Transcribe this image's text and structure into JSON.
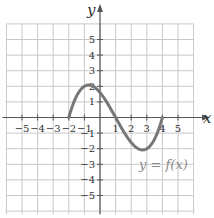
{
  "chart_data": {
    "type": "line",
    "title": "",
    "xlabel": "x",
    "ylabel": "y",
    "xlim": [
      -6,
      6
    ],
    "ylim": [
      -6,
      6
    ],
    "grid": true,
    "x_ticks": [
      "-5",
      "-4",
      "-3",
      "-2",
      "-1",
      "1",
      "2",
      "3",
      "4",
      "5"
    ],
    "y_ticks": [
      "5",
      "4",
      "3",
      "2",
      "1",
      "-1",
      "-2",
      "-3",
      "-4",
      "-5"
    ],
    "series": [
      {
        "name": "y = f(x)",
        "color": "#777777",
        "domain": [
          -2,
          4
        ],
        "x": [
          -2,
          -1.5,
          -1,
          -0.5,
          0,
          0.5,
          1,
          1.5,
          2,
          2.5,
          3,
          3.5,
          4
        ],
        "y": [
          0,
          1.1,
          2.0,
          2.0,
          1.6,
          0.9,
          0,
          -0.9,
          -1.6,
          -2.0,
          -2.0,
          -1.4,
          0
        ]
      }
    ],
    "annotations": [
      {
        "text": "y = f(x)",
        "x": 3,
        "y": -2.6
      }
    ]
  },
  "labels": {
    "x_axis": "x",
    "y_axis": "y",
    "function": "y = f(x)"
  }
}
